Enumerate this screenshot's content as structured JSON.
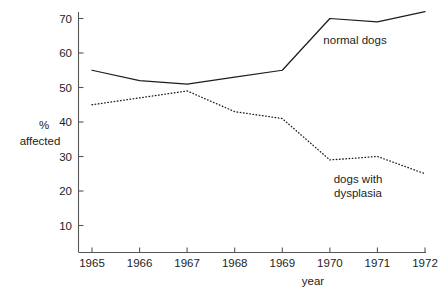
{
  "chart_data": {
    "type": "line",
    "title": "",
    "xlabel": "year",
    "ylabel": "% affected",
    "ylabel_lines": [
      "%",
      "affected"
    ],
    "x": [
      1965,
      1966,
      1967,
      1968,
      1969,
      1970,
      1971,
      1972
    ],
    "xtick_labels": [
      "1965",
      "1966",
      "1967",
      "1968",
      "1969",
      "1970",
      "1971",
      "1972"
    ],
    "ytick_labels": [
      "10",
      "20",
      "30",
      "40",
      "50",
      "60",
      "70"
    ],
    "yticks": [
      10,
      20,
      30,
      40,
      50,
      60,
      70
    ],
    "ylim": [
      0,
      74
    ],
    "xlim": [
      1965,
      1972
    ],
    "grid": false,
    "legend_position": "inline-annotation",
    "series": [
      {
        "name": "normal dogs",
        "label": "normal dogs",
        "style": "solid",
        "color": "#1d1d1d",
        "values": [
          55,
          52,
          51,
          53,
          55,
          70,
          69,
          72
        ],
        "annotation": {
          "text": "normal dogs",
          "x": 1970.55,
          "y": 64
        }
      },
      {
        "name": "dogs with dysplasia",
        "label": "dogs with dysplasia",
        "style": "dotted",
        "color": "#1d1d1d",
        "values": [
          45,
          47,
          49,
          43,
          41,
          29,
          30,
          25
        ],
        "annotation": {
          "text_lines": [
            "dogs with",
            "dysplasia"
          ],
          "x": 1970.0,
          "y": 21
        }
      }
    ],
    "annotations": [
      {
        "name": "normal-dogs-label",
        "text": "normal dogs"
      },
      {
        "name": "dysplasia-label-line-1",
        "text": "dogs with"
      },
      {
        "name": "dysplasia-label-line-2",
        "text": "dysplasia"
      }
    ],
    "axis_color": "#4a4a4a"
  }
}
